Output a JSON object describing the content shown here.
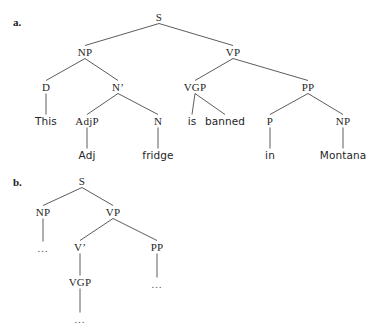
{
  "figure": {
    "kind": "syntax-tree-diagram",
    "background_color": "#ffffff",
    "line_color": "#4a4a4a",
    "text_color": "#262626",
    "width": 373,
    "height": 336
  },
  "panels": [
    {
      "label": "a.",
      "label_x": 13,
      "label_y": 22,
      "sentence": "This Adj fridge is banned in Montana",
      "nodes": [
        {
          "id": "a-S",
          "text": "S",
          "kind": "cat",
          "x": 159,
          "y": 17
        },
        {
          "id": "a-NP",
          "text": "NP",
          "kind": "cat",
          "x": 85,
          "y": 52
        },
        {
          "id": "a-VP",
          "text": "VP",
          "kind": "cat",
          "x": 233,
          "y": 52
        },
        {
          "id": "a-D",
          "text": "D",
          "kind": "cat",
          "x": 46,
          "y": 87
        },
        {
          "id": "a-Nbar",
          "text": "N’",
          "kind": "cat",
          "x": 118,
          "y": 87
        },
        {
          "id": "a-VGP",
          "text": "VGP",
          "kind": "cat",
          "x": 195,
          "y": 87
        },
        {
          "id": "a-PP",
          "text": "PP",
          "kind": "cat",
          "x": 308,
          "y": 87
        },
        {
          "id": "a-This",
          "text": "This",
          "kind": "word",
          "x": 46,
          "y": 121
        },
        {
          "id": "a-AdjP",
          "text": "AdjP",
          "kind": "cat",
          "x": 87,
          "y": 121
        },
        {
          "id": "a-N",
          "text": "N",
          "kind": "cat",
          "x": 158,
          "y": 121
        },
        {
          "id": "a-is",
          "text": "is",
          "kind": "word",
          "x": 192,
          "y": 121
        },
        {
          "id": "a-banned",
          "text": "banned",
          "kind": "word",
          "x": 225,
          "y": 121
        },
        {
          "id": "a-P",
          "text": "P",
          "kind": "cat",
          "x": 270,
          "y": 121
        },
        {
          "id": "a-NP2",
          "text": "NP",
          "kind": "cat",
          "x": 343,
          "y": 121
        },
        {
          "id": "a-Adj",
          "text": "Adj",
          "kind": "word",
          "x": 87,
          "y": 155
        },
        {
          "id": "a-fridge",
          "text": "fridge",
          "kind": "word",
          "x": 158,
          "y": 155
        },
        {
          "id": "a-in",
          "text": "in",
          "kind": "word",
          "x": 270,
          "y": 155
        },
        {
          "id": "a-Montana",
          "text": "Montana",
          "kind": "word",
          "x": 343,
          "y": 155
        }
      ],
      "edges": [
        {
          "from": "a-S",
          "to": "a-NP"
        },
        {
          "from": "a-S",
          "to": "a-VP"
        },
        {
          "from": "a-NP",
          "to": "a-D"
        },
        {
          "from": "a-NP",
          "to": "a-Nbar"
        },
        {
          "from": "a-VP",
          "to": "a-VGP"
        },
        {
          "from": "a-VP",
          "to": "a-PP"
        },
        {
          "from": "a-D",
          "to": "a-This"
        },
        {
          "from": "a-Nbar",
          "to": "a-AdjP"
        },
        {
          "from": "a-Nbar",
          "to": "a-N"
        },
        {
          "from": "a-VGP",
          "to": "a-is"
        },
        {
          "from": "a-VGP",
          "to": "a-banned"
        },
        {
          "from": "a-PP",
          "to": "a-P"
        },
        {
          "from": "a-PP",
          "to": "a-NP2"
        },
        {
          "from": "a-AdjP",
          "to": "a-Adj"
        },
        {
          "from": "a-N",
          "to": "a-fridge"
        },
        {
          "from": "a-P",
          "to": "a-in"
        },
        {
          "from": "a-NP2",
          "to": "a-Montana"
        }
      ]
    },
    {
      "label": "b.",
      "label_x": 13,
      "label_y": 182,
      "sentence": "",
      "nodes": [
        {
          "id": "b-S",
          "text": "S",
          "kind": "cat",
          "x": 82,
          "y": 181
        },
        {
          "id": "b-NP",
          "text": "NP",
          "kind": "cat",
          "x": 43,
          "y": 212
        },
        {
          "id": "b-VP",
          "text": "VP",
          "kind": "cat",
          "x": 113,
          "y": 212
        },
        {
          "id": "b-dot1",
          "text": "…",
          "kind": "ellipsis",
          "x": 43,
          "y": 248
        },
        {
          "id": "b-Vbar",
          "text": "V’",
          "kind": "cat",
          "x": 80,
          "y": 247
        },
        {
          "id": "b-PP",
          "text": "PP",
          "kind": "cat",
          "x": 157,
          "y": 247
        },
        {
          "id": "b-VGP",
          "text": "VGP",
          "kind": "cat",
          "x": 80,
          "y": 282
        },
        {
          "id": "b-dot2",
          "text": "…",
          "kind": "ellipsis",
          "x": 157,
          "y": 284
        },
        {
          "id": "b-dot3",
          "text": "…",
          "kind": "ellipsis",
          "x": 80,
          "y": 319
        }
      ],
      "edges": [
        {
          "from": "b-S",
          "to": "b-NP"
        },
        {
          "from": "b-S",
          "to": "b-VP"
        },
        {
          "from": "b-NP",
          "to": "b-dot1"
        },
        {
          "from": "b-VP",
          "to": "b-Vbar"
        },
        {
          "from": "b-VP",
          "to": "b-PP"
        },
        {
          "from": "b-Vbar",
          "to": "b-VGP"
        },
        {
          "from": "b-PP",
          "to": "b-dot2"
        },
        {
          "from": "b-VGP",
          "to": "b-dot3"
        }
      ]
    }
  ]
}
